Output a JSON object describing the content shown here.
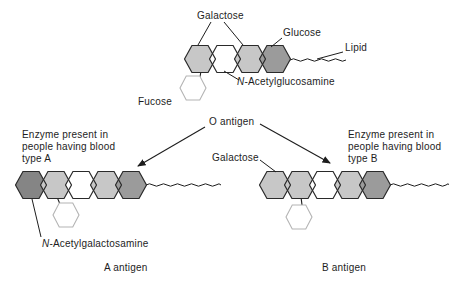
{
  "canvas": {
    "width": 469,
    "height": 284,
    "background": "#ffffff"
  },
  "colors": {
    "galactose": "#c7c7c7",
    "glucose": "#9b9b9b",
    "n_acetylglucosamine": "#ffffff",
    "fucose": "#ffffff",
    "n_acetylgalactosamine": "#858585",
    "line": "#1d1d1d",
    "fucose_outline": "#b4b4b4",
    "text": "#1d1d1d"
  },
  "labels": {
    "top_galactose": "Galactose",
    "glucose": "Glucose",
    "lipid": "Lipid",
    "fucose": "Fucose",
    "n_acetylglucosamine": {
      "prefix": "N",
      "rest": "-Acetylglucosamine"
    },
    "o_antigen": "O antigen",
    "mid_galactose": "Galactose",
    "enzyme_a": {
      "line1": "Enzyme present in",
      "line2": "people having blood",
      "line3": "type A"
    },
    "enzyme_b": {
      "line1": "Enzyme present in",
      "line2": "people having blood",
      "line3": "type B"
    },
    "n_acetylgalactosamine": {
      "prefix": "N",
      "rest": "-Acetylgalactosamine"
    },
    "a_antigen": "A antigen",
    "b_antigen": "B antigen"
  },
  "structures": {
    "o_chain": {
      "cy": 59,
      "hex_w": 31,
      "hex_h": 27,
      "centers": [
        200,
        225,
        250,
        275
      ],
      "sugars": [
        "galactose",
        "n_acetylglucosamine",
        "galactose",
        "glucose"
      ],
      "fucose": {
        "cx": 193,
        "cy": 88,
        "w": 26,
        "h": 24
      },
      "attach": {
        "x1": 201,
        "y1": 71,
        "x2": 200,
        "y2": 77
      },
      "wavy": {
        "x1": 290,
        "x2": 346,
        "y": 60
      }
    },
    "a_chain": {
      "cy": 185,
      "hex_w": 31,
      "hex_h": 27,
      "centers": [
        31,
        56,
        81,
        106,
        131
      ],
      "sugars": [
        "n_acetylgalactosamine",
        "galactose",
        "n_acetylglucosamine",
        "galactose",
        "glucose"
      ],
      "fucose": {
        "cx": 66,
        "cy": 215,
        "w": 26,
        "h": 24
      },
      "attach": {
        "x1": 57,
        "y1": 197,
        "x2": 60,
        "y2": 204
      },
      "wavy": {
        "x1": 146,
        "x2": 221,
        "y": 185
      }
    },
    "b_chain": {
      "cy": 185,
      "hex_w": 31,
      "hex_h": 27,
      "centers": [
        275,
        300,
        325,
        350,
        375
      ],
      "sugars": [
        "galactose",
        "galactose",
        "n_acetylglucosamine",
        "galactose",
        "glucose"
      ],
      "fucose": {
        "cx": 299,
        "cy": 217,
        "w": 26,
        "h": 24
      },
      "attach": {
        "x1": 301,
        "y1": 197,
        "x2": 302,
        "y2": 205
      },
      "wavy": {
        "x1": 390,
        "x2": 448,
        "y": 185
      }
    }
  }
}
